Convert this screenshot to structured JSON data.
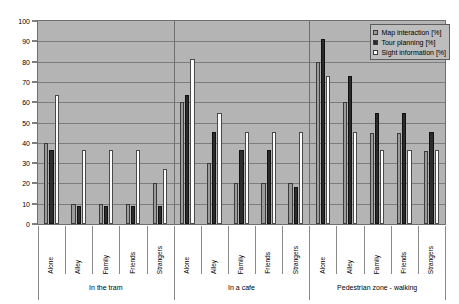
{
  "chart_data": {
    "type": "bar",
    "title": "",
    "xlabel": "",
    "ylabel": "",
    "ylim": [
      0,
      100
    ],
    "ytick_step": 10,
    "yticks": [
      0,
      10,
      20,
      30,
      40,
      50,
      60,
      70,
      80,
      90,
      100
    ],
    "grid": true,
    "legend_position": "top-right",
    "legend": [
      "Map interaction [%]",
      "Tour planning [%]",
      "Sight information [%]"
    ],
    "series_colors": [
      "#9a9a9a",
      "#2b2b2b",
      "#fdfdfd"
    ],
    "categories": [
      "Alone",
      "Alley",
      "Family",
      "Friends",
      "Strangers",
      "Alone",
      "Alley",
      "Family",
      "Friends",
      "Strangers",
      "Alone",
      "Alley",
      "Family",
      "Friends",
      "Strangers"
    ],
    "groups": [
      {
        "label": "In the tram",
        "categories": [
          "Alone",
          "Alley",
          "Family",
          "Friends",
          "Strangers"
        ]
      },
      {
        "label": "In a cafe",
        "categories": [
          "Alone",
          "Alley",
          "Family",
          "Friends",
          "Strangers"
        ]
      },
      {
        "label": "Pedestrian zone  - walking",
        "categories": [
          "Alone",
          "Alley",
          "Family",
          "Friends",
          "Strangers"
        ]
      }
    ],
    "series": [
      {
        "name": "Map interaction [%]",
        "color": "#9a9a9a",
        "values": [
          40,
          10,
          10,
          10,
          20,
          60,
          30,
          20,
          20,
          20,
          80,
          60,
          45,
          45,
          36
        ]
      },
      {
        "name": "Tour planning [%]",
        "color": "#2b2b2b",
        "values": [
          36.5,
          9,
          9,
          9,
          9,
          63.5,
          45.5,
          36.5,
          36.5,
          18,
          91,
          73,
          54.5,
          54.5,
          45.5
        ]
      },
      {
        "name": "Sight information [%]",
        "color": "#fdfdfd",
        "values": [
          63.5,
          36.5,
          36.5,
          36.5,
          27,
          81.5,
          54.5,
          45.5,
          45.5,
          45.5,
          73,
          45.5,
          36.5,
          36.5,
          36.5
        ]
      }
    ]
  }
}
